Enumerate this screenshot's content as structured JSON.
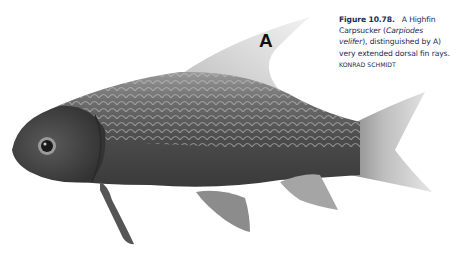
{
  "figure": {
    "label": "A",
    "image_subject": "Highfin Carpsucker fish, side view, photographed on white background",
    "caption": {
      "number": "Figure 10.78.",
      "text_part1": "A Highfin Carpsucker (",
      "scientific_name": "Carpiodes velifer",
      "text_part2": "), distinguished by A) very extended dorsal fin rays.",
      "credit": "KONRAD SCHMIDT"
    },
    "colors": {
      "caption_text": "#1c2a57",
      "background": "#ffffff"
    }
  }
}
